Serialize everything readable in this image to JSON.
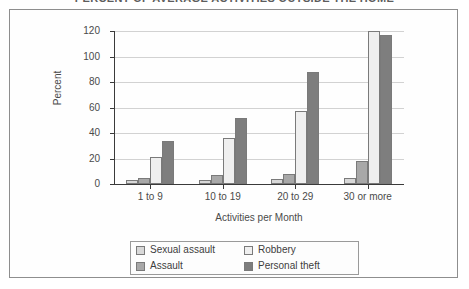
{
  "chart_data": {
    "type": "bar",
    "title": "PERCENT OF AVERAGE ACTIVITIES OUTSIDE THE HOME",
    "xlabel": "Activities per Month",
    "ylabel": "Percent",
    "ylim": [
      0,
      120
    ],
    "yticks": [
      0,
      20,
      40,
      60,
      80,
      100,
      120
    ],
    "grid": true,
    "legend_position": "bottom",
    "categories": [
      "1 to 9",
      "10 to 19",
      "20 to 29",
      "30 or more"
    ],
    "series": [
      {
        "name": "Sexual assault",
        "color": "#d8d8d8",
        "values": [
          3,
          3.5,
          4,
          5
        ]
      },
      {
        "name": "Assault",
        "color": "#a8a8a8",
        "values": [
          5,
          7,
          8,
          18
        ]
      },
      {
        "name": "Robbery",
        "color": "#efefef",
        "values": [
          21,
          36,
          57,
          120
        ]
      },
      {
        "name": "Personal theft",
        "color": "#7e7e7e",
        "values": [
          33.5,
          52,
          88,
          117
        ]
      }
    ]
  },
  "legend": {
    "entries": [
      {
        "label": "Sexual assault"
      },
      {
        "label": "Robbery"
      },
      {
        "label": "Assault"
      },
      {
        "label": "Personal theft"
      }
    ]
  }
}
